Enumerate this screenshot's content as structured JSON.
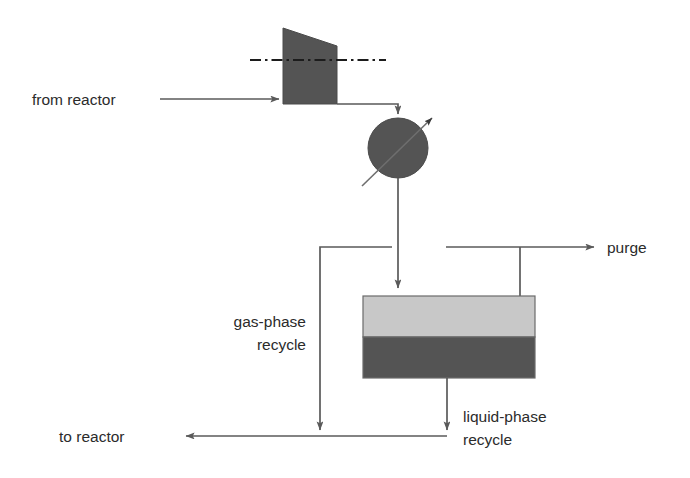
{
  "diagram": {
    "type": "process-flow-diagram",
    "canvas": {
      "width": 690,
      "height": 478,
      "background": "#ffffff"
    },
    "colors": {
      "line": "#5a5a5a",
      "text": "#2b2b2b",
      "compressor_fill": "#545454",
      "valve_fill": "#545454",
      "separator_gas_fill": "#c8c8c8",
      "separator_liquid_fill": "#545454",
      "separator_stroke": "#6b6b6b"
    },
    "labels": {
      "from_reactor": "from reactor",
      "purge": "purge",
      "gas_phase_recycle_line1": "gas-phase",
      "gas_phase_recycle_line2": "recycle",
      "liquid_phase_recycle_line1": "liquid-phase",
      "liquid_phase_recycle_line2": "recycle",
      "to_reactor": "to reactor"
    },
    "equipment": [
      {
        "name": "compressor",
        "shape": "trapezoid",
        "fill": "#545454",
        "centerline": "dash-dot"
      },
      {
        "name": "valve",
        "shape": "circle",
        "fill": "#545454",
        "marker": "diagonal-arrow"
      },
      {
        "name": "separator-vessel",
        "shape": "rectangle",
        "phases": [
          {
            "phase": "gas",
            "fill": "#c8c8c8"
          },
          {
            "phase": "liquid",
            "fill": "#545454"
          }
        ]
      }
    ],
    "streams": [
      {
        "name": "from-reactor-feed",
        "from": "reactor",
        "to": "compressor",
        "direction": "right"
      },
      {
        "name": "compressor-discharge",
        "from": "compressor",
        "to": "valve",
        "direction": "down"
      },
      {
        "name": "valve-outlet",
        "from": "valve",
        "to": "separator-vessel",
        "direction": "down"
      },
      {
        "name": "gas-overhead",
        "from": "separator-vessel",
        "to": "purge-and-gas-recycle",
        "direction": "up"
      },
      {
        "name": "purge-stream",
        "from": "gas-overhead",
        "to": "purge",
        "direction": "right"
      },
      {
        "name": "gas-phase-recycle",
        "from": "gas-overhead",
        "to": "to-reactor",
        "direction": "down"
      },
      {
        "name": "liquid-phase-recycle",
        "from": "separator-vessel",
        "to": "to-reactor",
        "direction": "down"
      },
      {
        "name": "to-reactor-return",
        "from": "recycle-junction",
        "to": "reactor",
        "direction": "left"
      }
    ]
  }
}
